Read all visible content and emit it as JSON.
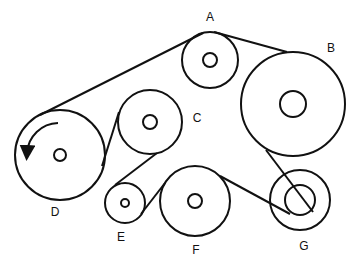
{
  "diagram": {
    "stroke_color": "#111111",
    "pulleys": [
      {
        "id": "A",
        "label": "A",
        "cx": 210,
        "cy": 60,
        "r": 28,
        "hub": 7,
        "lx": 210,
        "ly": 17
      },
      {
        "id": "B",
        "label": "B",
        "cx": 293,
        "cy": 104,
        "r": 52,
        "hub": 13,
        "lx": 331,
        "ly": 48
      },
      {
        "id": "C",
        "label": "C",
        "cx": 150,
        "cy": 122,
        "r": 32,
        "hub": 7,
        "lx": 197,
        "ly": 118
      },
      {
        "id": "D",
        "label": "D",
        "cx": 60,
        "cy": 155,
        "r": 45,
        "hub": 6,
        "lx": 55,
        "ly": 212
      },
      {
        "id": "E",
        "label": "E",
        "cx": 125,
        "cy": 203,
        "r": 20,
        "hub": 4,
        "lx": 121,
        "ly": 237
      },
      {
        "id": "F",
        "label": "F",
        "cx": 195,
        "cy": 201,
        "r": 35,
        "hub": 7,
        "lx": 196,
        "ly": 250
      },
      {
        "id": "G",
        "label": "G",
        "cx": 300,
        "cy": 200,
        "r": 30,
        "hub": 15,
        "lx": 304,
        "ly": 246
      }
    ],
    "rotation_arrow": {
      "pulley": "D",
      "direction": "counter-clockwise"
    }
  }
}
